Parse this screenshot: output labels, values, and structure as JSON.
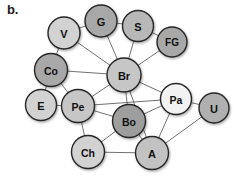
{
  "figure": {
    "panel_label": "b.",
    "background_color": "#ffffff",
    "edge_color": "#4d4d4d",
    "node_stroke_color": "#262626"
  },
  "chart_data": {
    "type": "diagram",
    "subtype": "node-link-network",
    "title": "",
    "panel": "b.",
    "layout": "force-directed",
    "node_count": 14,
    "edge_count": 30,
    "fills": {
      "light": "#d9d9d9",
      "medium": "#b3b3b3",
      "dark": "#9a9a9a",
      "white": "#f7f7f7"
    },
    "nodes": [
      {
        "id": "V",
        "label": "V",
        "x": 64,
        "y": 33,
        "r": 16,
        "fill": "#d2d2d2",
        "font_size": 11
      },
      {
        "id": "G",
        "label": "G",
        "x": 101,
        "y": 21,
        "r": 16,
        "fill": "#a8a8a8",
        "font_size": 11
      },
      {
        "id": "S",
        "label": "S",
        "x": 138,
        "y": 26,
        "r": 15.5,
        "fill": "#b8b8b8",
        "font_size": 11
      },
      {
        "id": "FG",
        "label": "FG",
        "x": 172,
        "y": 42,
        "r": 15,
        "fill": "#a8a8a8",
        "font_size": 10
      },
      {
        "id": "Co",
        "label": "Co",
        "x": 51,
        "y": 70,
        "r": 16.5,
        "fill": "#a8a8a8",
        "font_size": 10.5
      },
      {
        "id": "Br",
        "label": "Br",
        "x": 124,
        "y": 75,
        "r": 17,
        "fill": "#c6c6c6",
        "font_size": 11
      },
      {
        "id": "E",
        "label": "E",
        "x": 41,
        "y": 105,
        "r": 15.5,
        "fill": "#d2d2d2",
        "font_size": 11
      },
      {
        "id": "Pe",
        "label": "Pe",
        "x": 78,
        "y": 106,
        "r": 16.5,
        "fill": "#c6c6c6",
        "font_size": 10.5
      },
      {
        "id": "Pa",
        "label": "Pa",
        "x": 176,
        "y": 99,
        "r": 15.5,
        "fill": "#f2f2f2",
        "font_size": 10.5
      },
      {
        "id": "U",
        "label": "U",
        "x": 214,
        "y": 108,
        "r": 15,
        "fill": "#b0b0b0",
        "font_size": 11
      },
      {
        "id": "Bo",
        "label": "Bo",
        "x": 129,
        "y": 121,
        "r": 16.5,
        "fill": "#9e9e9e",
        "font_size": 10.5
      },
      {
        "id": "Ch",
        "label": "Ch",
        "x": 88,
        "y": 152,
        "r": 16.5,
        "fill": "#d2d2d2",
        "font_size": 10.5
      },
      {
        "id": "A",
        "label": "A",
        "x": 152,
        "y": 153,
        "r": 16.5,
        "fill": "#c2c2c2",
        "font_size": 11
      }
    ],
    "edges": [
      [
        "V",
        "G"
      ],
      [
        "V",
        "Co"
      ],
      [
        "V",
        "Br"
      ],
      [
        "G",
        "S"
      ],
      [
        "G",
        "Br"
      ],
      [
        "S",
        "Br"
      ],
      [
        "S",
        "FG"
      ],
      [
        "FG",
        "Br"
      ],
      [
        "Co",
        "Br"
      ],
      [
        "Co",
        "E"
      ],
      [
        "Co",
        "Pe"
      ],
      [
        "E",
        "Pe"
      ],
      [
        "Pe",
        "Br"
      ],
      [
        "Pe",
        "Bo"
      ],
      [
        "Pe",
        "Ch"
      ],
      [
        "Pe",
        "Pa"
      ],
      [
        "Br",
        "Bo"
      ],
      [
        "Br",
        "Pa"
      ],
      [
        "Br",
        "A"
      ],
      [
        "Br",
        "Bo2"
      ],
      [
        "Pa",
        "U"
      ],
      [
        "Pa",
        "A"
      ],
      [
        "Pa",
        "Bo"
      ],
      [
        "U",
        "A"
      ],
      [
        "Bo",
        "A"
      ],
      [
        "Bo",
        "Ch"
      ],
      [
        "Ch",
        "A"
      ]
    ]
  }
}
